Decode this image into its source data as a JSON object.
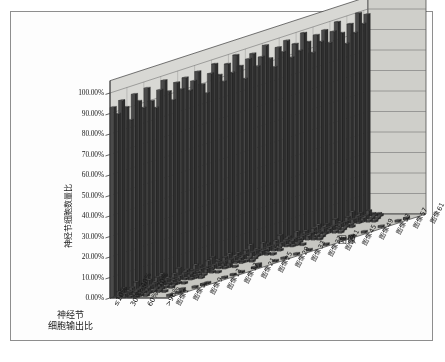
{
  "chart_data": {
    "type": "bar",
    "title": "",
    "subtitle": "",
    "xlabel": "神经节\n细胞输出比",
    "ylabel": "神经节细胞数量比",
    "zlabel": "图像",
    "ylim": [
      0,
      1.0
    ],
    "grid": true,
    "legend_position": "none",
    "projection": "3d",
    "yticks": [
      "0.00%",
      "10.00%",
      "20.00%",
      "30.00%",
      "40.00%",
      "50.00%",
      "60.00%",
      "70.00%",
      "80.00%",
      "90.00%",
      "100.00%"
    ],
    "ytick_values": [
      0,
      0.1,
      0.2,
      0.3,
      0.4,
      0.5,
      0.6,
      0.7,
      0.8,
      0.9,
      1.0
    ],
    "categories": [
      "≤10%",
      "10%~20%",
      "20%~30%",
      "30%~40%",
      "40%~50%",
      "50%~60%",
      "60%~70%",
      "70%~80%",
      "80%~90%",
      ">90%"
    ],
    "category_ticklabels": [
      "≤10%",
      "30%~40%",
      "60%~70%",
      ">90%"
    ],
    "category_ticklabel_index": [
      0,
      3,
      6,
      9
    ],
    "depth_categories": [
      "图像1",
      "图像2",
      "图像3",
      "图像4",
      "图像5",
      "图像6",
      "图像7",
      "图像8",
      "图像9",
      "图像10",
      "图像11",
      "图像12",
      "图像13",
      "图像14",
      "图像15",
      "图像16",
      "图像17",
      "图像18",
      "图像19",
      "图像20",
      "图像21",
      "图像22",
      "图像23",
      "图像24",
      "图像25",
      "图像26",
      "图像27",
      "图像28",
      "图像29",
      "图像30",
      "图像31",
      "图像32",
      "图像33",
      "图像34",
      "图像35",
      "图像36",
      "图像37",
      "图像38",
      "图像39",
      "图像40",
      "图像41",
      "图像42",
      "图像43",
      "图像44",
      "图像45",
      "图像46",
      "图像47",
      "图像48",
      "图像49",
      "图像50",
      "图像51",
      "图像52",
      "图像53",
      "图像54",
      "图像55",
      "图像56",
      "图像57",
      "图像58",
      "图像59",
      "图像60",
      "图像61"
    ],
    "depth_ticklabels": [
      "图像1",
      "图像5",
      "图像9",
      "图像13",
      "图像17",
      "图像21",
      "图像25",
      "图像29",
      "图像33",
      "图像37",
      "图像41",
      "图像45",
      "图像49",
      "图像53",
      "图像57",
      "图像61"
    ],
    "depth_ticklabel_index": [
      0,
      4,
      8,
      12,
      16,
      20,
      24,
      28,
      32,
      36,
      40,
      44,
      48,
      52,
      56,
      60
    ],
    "series": [
      {
        "name": "图像1",
        "values": [
          0.93,
          0.03,
          0.02,
          0.01,
          0.01,
          0.0,
          0.0,
          0.0,
          0.0,
          0.0
        ]
      },
      {
        "name": "图像2",
        "values": [
          0.89,
          0.04,
          0.02,
          0.02,
          0.01,
          0.01,
          0.0,
          0.0,
          0.0,
          0.01
        ]
      },
      {
        "name": "图像3",
        "values": [
          0.95,
          0.02,
          0.01,
          0.01,
          0.0,
          0.0,
          0.0,
          0.0,
          0.0,
          0.0
        ]
      },
      {
        "name": "图像4",
        "values": [
          0.91,
          0.03,
          0.02,
          0.01,
          0.01,
          0.0,
          0.0,
          0.0,
          0.0,
          0.01
        ]
      },
      {
        "name": "图像5",
        "values": [
          0.84,
          0.05,
          0.03,
          0.02,
          0.01,
          0.01,
          0.01,
          0.0,
          0.0,
          0.02
        ]
      },
      {
        "name": "图像6",
        "values": [
          0.96,
          0.02,
          0.01,
          0.0,
          0.0,
          0.0,
          0.0,
          0.0,
          0.0,
          0.0
        ]
      },
      {
        "name": "图像7",
        "values": [
          0.92,
          0.03,
          0.02,
          0.01,
          0.01,
          0.0,
          0.0,
          0.0,
          0.0,
          0.0
        ]
      },
      {
        "name": "图像8",
        "values": [
          0.88,
          0.04,
          0.03,
          0.02,
          0.01,
          0.01,
          0.0,
          0.0,
          0.0,
          0.01
        ]
      },
      {
        "name": "图像9",
        "values": [
          0.97,
          0.01,
          0.01,
          0.0,
          0.0,
          0.0,
          0.0,
          0.0,
          0.0,
          0.0
        ]
      },
      {
        "name": "图像10",
        "values": [
          0.9,
          0.04,
          0.02,
          0.01,
          0.01,
          0.0,
          0.0,
          0.0,
          0.0,
          0.01
        ]
      },
      {
        "name": "图像11",
        "values": [
          0.86,
          0.05,
          0.03,
          0.02,
          0.01,
          0.01,
          0.0,
          0.0,
          0.0,
          0.01
        ]
      },
      {
        "name": "图像12",
        "values": [
          0.94,
          0.02,
          0.02,
          0.01,
          0.0,
          0.0,
          0.0,
          0.0,
          0.0,
          0.0
        ]
      },
      {
        "name": "图像13",
        "values": [
          0.98,
          0.01,
          0.01,
          0.0,
          0.0,
          0.0,
          0.0,
          0.0,
          0.0,
          0.0
        ]
      },
      {
        "name": "图像14",
        "values": [
          0.92,
          0.03,
          0.02,
          0.01,
          0.01,
          0.0,
          0.0,
          0.0,
          0.0,
          0.0
        ]
      },
      {
        "name": "图像15",
        "values": [
          0.87,
          0.05,
          0.03,
          0.02,
          0.01,
          0.01,
          0.0,
          0.0,
          0.0,
          0.01
        ]
      },
      {
        "name": "图像16",
        "values": [
          0.95,
          0.02,
          0.01,
          0.01,
          0.0,
          0.0,
          0.0,
          0.0,
          0.0,
          0.0
        ]
      },
      {
        "name": "图像17",
        "values": [
          0.91,
          0.03,
          0.02,
          0.01,
          0.01,
          0.0,
          0.0,
          0.0,
          0.0,
          0.01
        ]
      },
      {
        "name": "图像18",
        "values": [
          0.96,
          0.02,
          0.01,
          0.0,
          0.0,
          0.0,
          0.0,
          0.0,
          0.0,
          0.0
        ]
      },
      {
        "name": "图像19",
        "values": [
          0.89,
          0.04,
          0.02,
          0.02,
          0.01,
          0.01,
          0.0,
          0.0,
          0.0,
          0.01
        ]
      },
      {
        "name": "图像20",
        "values": [
          0.93,
          0.03,
          0.02,
          0.01,
          0.0,
          0.0,
          0.0,
          0.0,
          0.0,
          0.0
        ]
      },
      {
        "name": "图像21",
        "values": [
          0.97,
          0.01,
          0.01,
          0.0,
          0.0,
          0.0,
          0.0,
          0.0,
          0.0,
          0.0
        ]
      },
      {
        "name": "图像22",
        "values": [
          0.9,
          0.04,
          0.02,
          0.01,
          0.01,
          0.0,
          0.0,
          0.0,
          0.0,
          0.01
        ]
      },
      {
        "name": "图像23",
        "values": [
          0.85,
          0.05,
          0.03,
          0.02,
          0.02,
          0.01,
          0.0,
          0.0,
          0.0,
          0.02
        ]
      },
      {
        "name": "图像24",
        "values": [
          0.94,
          0.03,
          0.01,
          0.01,
          0.0,
          0.0,
          0.0,
          0.0,
          0.0,
          0.0
        ]
      },
      {
        "name": "图像25",
        "values": [
          0.98,
          0.01,
          0.0,
          0.0,
          0.0,
          0.0,
          0.0,
          0.0,
          0.0,
          0.0
        ]
      },
      {
        "name": "图像26",
        "values": [
          0.92,
          0.03,
          0.02,
          0.01,
          0.01,
          0.0,
          0.0,
          0.0,
          0.0,
          0.0
        ]
      },
      {
        "name": "图像27",
        "values": [
          0.88,
          0.04,
          0.03,
          0.02,
          0.01,
          0.01,
          0.0,
          0.0,
          0.0,
          0.01
        ]
      },
      {
        "name": "图像28",
        "values": [
          0.96,
          0.02,
          0.01,
          0.0,
          0.0,
          0.0,
          0.0,
          0.0,
          0.0,
          0.0
        ]
      },
      {
        "name": "图像29",
        "values": [
          0.91,
          0.03,
          0.02,
          0.01,
          0.01,
          0.0,
          0.0,
          0.0,
          0.0,
          0.01
        ]
      },
      {
        "name": "图像30",
        "values": [
          0.99,
          0.01,
          0.0,
          0.0,
          0.0,
          0.0,
          0.0,
          0.0,
          0.0,
          0.0
        ]
      },
      {
        "name": "图像31",
        "values": [
          0.93,
          0.03,
          0.02,
          0.01,
          0.0,
          0.0,
          0.0,
          0.0,
          0.0,
          0.0
        ]
      },
      {
        "name": "图像32",
        "values": [
          0.86,
          0.05,
          0.03,
          0.02,
          0.01,
          0.01,
          0.0,
          0.0,
          0.0,
          0.01
        ]
      },
      {
        "name": "图像33",
        "values": [
          0.95,
          0.02,
          0.01,
          0.01,
          0.0,
          0.0,
          0.0,
          0.0,
          0.0,
          0.0
        ]
      },
      {
        "name": "图像34",
        "values": [
          0.97,
          0.01,
          0.01,
          0.0,
          0.0,
          0.0,
          0.0,
          0.0,
          0.0,
          0.0
        ]
      },
      {
        "name": "图像35",
        "values": [
          0.9,
          0.04,
          0.02,
          0.01,
          0.01,
          0.0,
          0.0,
          0.0,
          0.0,
          0.01
        ]
      },
      {
        "name": "图像36",
        "values": [
          0.94,
          0.03,
          0.01,
          0.01,
          0.0,
          0.0,
          0.0,
          0.0,
          0.0,
          0.0
        ]
      },
      {
        "name": "图像37",
        "values": [
          0.99,
          0.01,
          0.0,
          0.0,
          0.0,
          0.0,
          0.0,
          0.0,
          0.0,
          0.0
        ]
      },
      {
        "name": "图像38",
        "values": [
          0.92,
          0.03,
          0.02,
          0.01,
          0.01,
          0.0,
          0.0,
          0.0,
          0.0,
          0.0
        ]
      },
      {
        "name": "图像39",
        "values": [
          0.87,
          0.05,
          0.03,
          0.02,
          0.01,
          0.01,
          0.0,
          0.0,
          0.0,
          0.01
        ]
      },
      {
        "name": "图像40",
        "values": [
          0.96,
          0.02,
          0.01,
          0.0,
          0.0,
          0.0,
          0.0,
          0.0,
          0.0,
          0.0
        ]
      },
      {
        "name": "图像41",
        "values": [
          0.93,
          0.03,
          0.02,
          0.01,
          0.0,
          0.0,
          0.0,
          0.0,
          0.0,
          0.0
        ]
      },
      {
        "name": "图像42",
        "values": [
          0.98,
          0.01,
          0.01,
          0.0,
          0.0,
          0.0,
          0.0,
          0.0,
          0.0,
          0.0
        ]
      },
      {
        "name": "图像43",
        "values": [
          0.89,
          0.04,
          0.02,
          0.02,
          0.01,
          0.01,
          0.0,
          0.0,
          0.0,
          0.01
        ]
      },
      {
        "name": "图像44",
        "values": [
          0.95,
          0.02,
          0.01,
          0.01,
          0.0,
          0.0,
          0.0,
          0.0,
          0.0,
          0.0
        ]
      },
      {
        "name": "图像45",
        "values": [
          0.91,
          0.03,
          0.02,
          0.01,
          0.01,
          0.0,
          0.0,
          0.0,
          0.0,
          0.01
        ]
      },
      {
        "name": "图像46",
        "values": [
          0.99,
          0.01,
          0.0,
          0.0,
          0.0,
          0.0,
          0.0,
          0.0,
          0.0,
          0.0
        ]
      },
      {
        "name": "图像47",
        "values": [
          0.94,
          0.03,
          0.01,
          0.01,
          0.0,
          0.0,
          0.0,
          0.0,
          0.0,
          0.0
        ]
      },
      {
        "name": "图像48",
        "values": [
          0.88,
          0.04,
          0.03,
          0.02,
          0.01,
          0.01,
          0.0,
          0.0,
          0.0,
          0.01
        ]
      },
      {
        "name": "图像49",
        "values": [
          0.96,
          0.02,
          0.01,
          0.0,
          0.0,
          0.0,
          0.0,
          0.0,
          0.0,
          0.0
        ]
      },
      {
        "name": "图像50",
        "values": [
          0.92,
          0.03,
          0.02,
          0.01,
          0.01,
          0.0,
          0.0,
          0.0,
          0.0,
          0.0
        ]
      },
      {
        "name": "图像51",
        "values": [
          0.97,
          0.01,
          0.01,
          0.0,
          0.0,
          0.0,
          0.0,
          0.0,
          0.0,
          0.0
        ]
      },
      {
        "name": "图像52",
        "values": [
          0.9,
          0.04,
          0.02,
          0.01,
          0.01,
          0.0,
          0.0,
          0.0,
          0.0,
          0.01
        ]
      },
      {
        "name": "图像53",
        "values": [
          0.95,
          0.02,
          0.02,
          0.01,
          0.0,
          0.0,
          0.0,
          0.0,
          0.0,
          0.0
        ]
      },
      {
        "name": "图像54",
        "values": [
          0.99,
          0.01,
          0.0,
          0.0,
          0.0,
          0.0,
          0.0,
          0.0,
          0.0,
          0.0
        ]
      },
      {
        "name": "图像55",
        "values": [
          0.93,
          0.03,
          0.02,
          0.01,
          0.0,
          0.0,
          0.0,
          0.0,
          0.0,
          0.0
        ]
      },
      {
        "name": "图像56",
        "values": [
          0.87,
          0.05,
          0.03,
          0.02,
          0.01,
          0.01,
          0.0,
          0.0,
          0.0,
          0.01
        ]
      },
      {
        "name": "图像57",
        "values": [
          0.96,
          0.02,
          0.01,
          0.0,
          0.0,
          0.0,
          0.0,
          0.0,
          0.0,
          0.0
        ]
      },
      {
        "name": "图像58",
        "values": [
          0.91,
          0.03,
          0.02,
          0.01,
          0.01,
          0.0,
          0.0,
          0.0,
          0.0,
          0.01
        ]
      },
      {
        "name": "图像59",
        "values": [
          1.0,
          0.0,
          0.0,
          0.0,
          0.0,
          0.0,
          0.0,
          0.0,
          0.0,
          0.0
        ]
      },
      {
        "name": "图像60",
        "values": [
          0.94,
          0.03,
          0.01,
          0.01,
          0.0,
          0.0,
          0.0,
          0.0,
          0.0,
          0.0
        ]
      },
      {
        "name": "图像61",
        "values": [
          0.98,
          0.01,
          0.01,
          0.0,
          0.0,
          0.0,
          0.0,
          0.0,
          0.0,
          0.0
        ]
      }
    ]
  },
  "axes": {
    "value_axis_title": "神经节细胞数量比",
    "category_axis_title_line1": "神经节",
    "category_axis_title_line2": "细胞输出比",
    "depth_axis_title": "图像"
  },
  "colors": {
    "bar_fill": "#4a4a4a",
    "bar_side": "#2e2e2e",
    "bar_top": "#6e6e6e",
    "wall_back": "#d8d8d4",
    "wall_side": "#cfcfca",
    "floor": "#c6c6c1",
    "gridline": "#6b6b6b",
    "axis_line": "#3a3a3a",
    "frame": "#8e8e8e",
    "background": "#fdfdfd",
    "text": "#1a1a1a"
  }
}
